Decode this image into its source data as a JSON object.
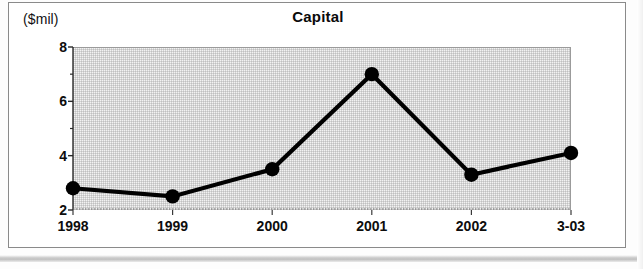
{
  "chart_data": {
    "type": "line",
    "title": "Capital",
    "ylabel": "($mil)",
    "xlabel": "",
    "categories": [
      "1998",
      "1999",
      "2000",
      "2001",
      "2002",
      "3-03"
    ],
    "values": [
      2.8,
      2.5,
      3.5,
      7.0,
      3.3,
      4.1
    ],
    "series": [
      {
        "name": "Capital",
        "values": [
          2.8,
          2.5,
          3.5,
          7.0,
          3.3,
          4.1
        ]
      }
    ],
    "ylim": [
      2,
      8
    ],
    "yticks": [
      2,
      4,
      6,
      8
    ],
    "ytick_labels": [
      "2",
      "4",
      "6",
      "8"
    ],
    "grid": false,
    "legend": "none",
    "marker": "filled-circle",
    "line_color": "#000000",
    "marker_color": "#000000",
    "plot_background": "#f2f2f2"
  },
  "colors": {
    "line": "#000000",
    "marker": "#000000",
    "plot_bg": "#f2f2f2",
    "frame": "#8a8a8a",
    "text": "#0d0d0d"
  }
}
